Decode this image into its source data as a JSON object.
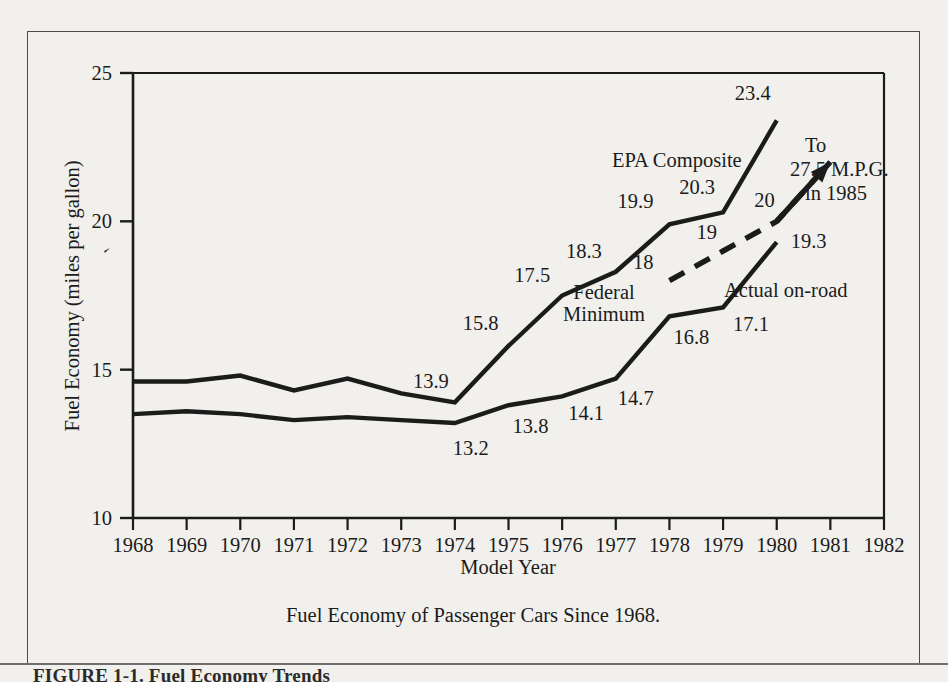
{
  "figure": {
    "caption": "Fuel Economy of Passenger Cars Since 1968.",
    "page_footer": "FIGURE 1-1.  Fuel Economy Trends",
    "frame_color": "#4a4a4a",
    "paper_color": "#f1f0ed",
    "ink_color": "#1b1b1b"
  },
  "chart_data": {
    "type": "line",
    "title": "Fuel Economy of Passenger Cars Since 1968.",
    "xlabel": "Model Year",
    "ylabel": "Fuel Economy (miles per gallon)",
    "xlim": [
      1968,
      1982
    ],
    "ylim": [
      10,
      25
    ],
    "yticks": [
      "10",
      "15",
      "20",
      "25"
    ],
    "ytick_values": [
      10,
      15,
      20,
      25
    ],
    "grid": false,
    "legend": "inline-annotations",
    "categories": [
      1968,
      1969,
      1970,
      1971,
      1972,
      1973,
      1974,
      1975,
      1976,
      1977,
      1978,
      1979,
      1980
    ],
    "xticks": [
      "1968",
      "1969",
      "1970",
      "1971",
      "1972",
      "1973",
      "1974",
      "1975",
      "1976",
      "1977",
      "1978",
      "1979",
      "1980",
      "1981",
      "1982"
    ],
    "xtick_values": [
      1968,
      1969,
      1970,
      1971,
      1972,
      1973,
      1974,
      1975,
      1976,
      1977,
      1978,
      1979,
      1980,
      1981,
      1982
    ],
    "series": [
      {
        "name": "EPA Composite",
        "style": "solid",
        "x": [
          1968,
          1969,
          1970,
          1971,
          1972,
          1973,
          1974,
          1975,
          1976,
          1977,
          1978,
          1979,
          1980
        ],
        "values": [
          14.6,
          14.6,
          14.8,
          14.3,
          14.7,
          14.2,
          13.9,
          15.8,
          17.5,
          18.3,
          19.9,
          20.3,
          23.4
        ],
        "labeled_points": [
          {
            "x": 1974,
            "y": 13.9,
            "label": "13.9"
          },
          {
            "x": 1975,
            "y": 15.8,
            "label": "15.8"
          },
          {
            "x": 1976,
            "y": 17.5,
            "label": "17.5"
          },
          {
            "x": 1977,
            "y": 18.3,
            "label": "18.3"
          },
          {
            "x": 1978,
            "y": 19.9,
            "label": "19.9"
          },
          {
            "x": 1979,
            "y": 20.3,
            "label": "20.3"
          },
          {
            "x": 1980,
            "y": 23.4,
            "label": "23.4"
          }
        ]
      },
      {
        "name": "Actual on-road",
        "style": "solid",
        "x": [
          1968,
          1969,
          1970,
          1971,
          1972,
          1973,
          1974,
          1975,
          1976,
          1977,
          1978,
          1979,
          1980
        ],
        "values": [
          13.5,
          13.6,
          13.5,
          13.3,
          13.4,
          13.3,
          13.2,
          13.8,
          14.1,
          14.7,
          16.8,
          17.1,
          19.3
        ],
        "labeled_points": [
          {
            "x": 1974,
            "y": 13.2,
            "label": "13.2"
          },
          {
            "x": 1975,
            "y": 13.8,
            "label": "13.8"
          },
          {
            "x": 1976,
            "y": 14.1,
            "label": "14.1"
          },
          {
            "x": 1977,
            "y": 14.7,
            "label": "14.7"
          },
          {
            "x": 1978,
            "y": 16.8,
            "label": "16.8"
          },
          {
            "x": 1979,
            "y": 17.1,
            "label": "17.1"
          },
          {
            "x": 1980,
            "y": 19.3,
            "label": "19.3"
          }
        ]
      },
      {
        "name": "Federal Minimum",
        "style": "dashed",
        "x": [
          1978,
          1979,
          1980,
          1981
        ],
        "values": [
          18,
          19,
          20,
          22.0
        ],
        "arrow_end": true,
        "labeled_points": [
          {
            "x": 1978,
            "y": 18,
            "label": "18"
          },
          {
            "x": 1979,
            "y": 19,
            "label": "19"
          },
          {
            "x": 1980,
            "y": 20,
            "label": "20"
          }
        ]
      }
    ],
    "annotations": [
      {
        "name": "epa-composite-label",
        "text": "EPA Composite"
      },
      {
        "name": "federal-minimum-label-line1",
        "text": "Federal"
      },
      {
        "name": "federal-minimum-label-line2",
        "text": "Minimum"
      },
      {
        "name": "actual-on-road-label",
        "text": "Actual on-road"
      },
      {
        "name": "target-label-line1",
        "text": "To"
      },
      {
        "name": "target-label-line2",
        "text": "27.5 M.P.G."
      },
      {
        "name": "target-label-line3",
        "text": "in 1985"
      }
    ]
  }
}
